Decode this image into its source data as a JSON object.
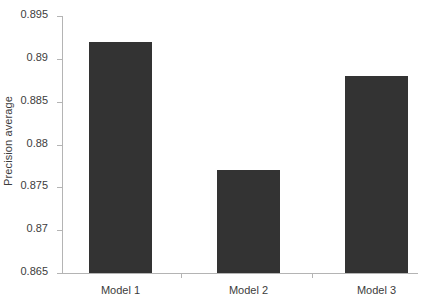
{
  "chart_data": {
    "type": "bar",
    "title": "",
    "subtitle": "",
    "categories": [
      "Model 1",
      "Model 2",
      "Model 3"
    ],
    "values": [
      0.892,
      0.877,
      0.888
    ],
    "series": [
      {
        "name": "Precision average",
        "values": [
          0.892,
          0.877,
          0.888
        ]
      }
    ],
    "xlabel": "",
    "ylabel": "Precision average",
    "ylim": [
      0.865,
      0.895
    ],
    "yticks": [
      0.895,
      0.89,
      0.885,
      0.88,
      0.875,
      0.87,
      0.865
    ],
    "ytick_labels": [
      "0.895",
      "0.89",
      "0.885",
      "0.88",
      "0.875",
      "0.87",
      "0.865"
    ],
    "grid": false,
    "legend": false,
    "legend_position": "none",
    "bar_color": "#333333",
    "axis_color": "#b4b4b4",
    "text_color": "#3c3c3c",
    "background_color": "#ffffff"
  },
  "axis": {
    "y_title": "Precision average",
    "tick_labels": [
      "0.895",
      "0.89",
      "0.885",
      "0.88",
      "0.875",
      "0.87",
      "0.865"
    ],
    "category_labels": [
      "Model 1",
      "Model 2",
      "Model 3"
    ]
  }
}
